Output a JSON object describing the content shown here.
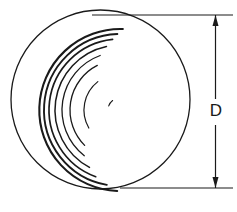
{
  "drawing": {
    "title": "Sphere diameter dimension drawing",
    "background_color": "#ffffff",
    "line_color": "#1a1a1a",
    "view_type": "orthographic-elevation",
    "object": {
      "name": "sphere",
      "shape": "circle",
      "outline": {
        "center_x": 100.5,
        "center_y": 99.5,
        "radius": 89.5,
        "stroke_width": 1.3
      }
    },
    "surface_arcs": {
      "description": "concentric machining / turning marks in lower-right quadrant",
      "center_x": 120,
      "center_y": 110,
      "count": 8,
      "arcs": [
        {
          "radius": 12,
          "start_deg": 200,
          "end_deg": 232,
          "stroke_width": 1.1
        },
        {
          "radius": 36,
          "start_deg": 150,
          "end_deg": 232,
          "stroke_width": 1.2
        },
        {
          "radius": 50,
          "start_deg": 135,
          "end_deg": 243,
          "stroke_width": 1.3
        },
        {
          "radius": 58,
          "start_deg": 128,
          "end_deg": 250,
          "stroke_width": 1.3
        },
        {
          "radius": 65,
          "start_deg": 118,
          "end_deg": 258,
          "stroke_width": 1.5
        },
        {
          "radius": 71,
          "start_deg": 110,
          "end_deg": 264,
          "stroke_width": 1.7
        },
        {
          "radius": 76,
          "start_deg": 100,
          "end_deg": 268,
          "stroke_width": 1.9
        },
        {
          "radius": 81,
          "start_deg": 92,
          "end_deg": 272,
          "stroke_width": 2.1
        }
      ]
    },
    "dimension": {
      "label": "D",
      "meaning": "diameter",
      "label_x": 216,
      "label_y": 112,
      "line_x": 215.5,
      "arrow_top_y": 15,
      "arrow_bottom_y": 188,
      "arrow_width": 6,
      "arrow_length": 11,
      "stroke_width": 1.2,
      "extension_lines": [
        {
          "name": "top-extension-line",
          "x1": 92,
          "y1": 15,
          "x2": 233,
          "y2": 15
        },
        {
          "name": "bottom-extension-line",
          "x1": 120,
          "y1": 188,
          "x2": 233,
          "y2": 188
        }
      ]
    }
  }
}
